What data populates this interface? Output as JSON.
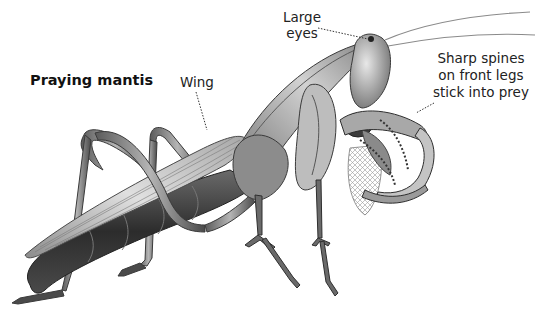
{
  "diagram": {
    "title": "Praying mantis",
    "labels": {
      "wing": "Wing",
      "eyes_line1": "Large",
      "eyes_line2": "eyes",
      "spines_line1": "Sharp spines",
      "spines_line2": "on front legs",
      "spines_line3": "stick into prey"
    },
    "prey": "captured-insect",
    "colors": {
      "background": "#ffffff",
      "text": "#222222",
      "leader_line": "#333333",
      "body_light": "#d9d9d9",
      "body_mid": "#9a9a9a",
      "body_dark": "#3c3c3c"
    }
  }
}
